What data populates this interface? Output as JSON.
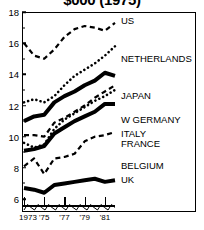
{
  "chart": {
    "title": "$000 (1975)",
    "type": "line",
    "xlabel": "",
    "ylabel": "",
    "legend_position": "inline-right"
  },
  "chart_data": {
    "type": "line",
    "title": "$000 (1975)",
    "xlabel": "",
    "ylabel": "",
    "xlim": [
      1973,
      1982
    ],
    "ylim": [
      5.2,
      18
    ],
    "grid": false,
    "legend_position": "inline-right",
    "x": [
      1973,
      1974,
      1975,
      1976,
      1977,
      1978,
      1979,
      1980,
      1981,
      1982
    ],
    "y_ticks": [
      6,
      8,
      10,
      12,
      14,
      16,
      18
    ],
    "x_tick_labels": [
      "1973",
      "'75",
      "'77",
      "'79",
      "'81"
    ],
    "x_tick_values": [
      1973,
      1975,
      1977,
      1979,
      1981
    ],
    "series": [
      {
        "name": "US",
        "style": "dashed",
        "width": 2.2,
        "label_y": 17.4,
        "values": [
          16.0,
          15.2,
          15.0,
          15.6,
          16.4,
          16.9,
          17.1,
          17.0,
          16.8,
          17.3
        ]
      },
      {
        "name": "NETHERLANDS",
        "style": "dotted",
        "width": 2.6,
        "label_y": 15.0,
        "values": [
          12.2,
          12.4,
          12.2,
          12.6,
          13.3,
          13.9,
          14.3,
          14.7,
          15.2,
          15.8
        ]
      },
      {
        "name": "JAPAN",
        "style": "dotted",
        "width": 2.6,
        "label_y": 12.6,
        "values": [
          9.6,
          9.3,
          9.5,
          10.5,
          11.1,
          11.5,
          11.9,
          12.3,
          12.6,
          13.0
        ]
      },
      {
        "name": "W GERMANY",
        "style": "solid-thick",
        "width": 4.0,
        "label_y": 11.1,
        "values": [
          11.0,
          11.3,
          11.4,
          12.2,
          12.6,
          12.9,
          13.3,
          13.6,
          14.1,
          13.9
        ]
      },
      {
        "name": "FRANCE",
        "style": "dashed",
        "width": 2.2,
        "label_y": 9.5,
        "values": [
          10.1,
          10.1,
          10.0,
          10.9,
          11.2,
          11.6,
          12.0,
          12.5,
          12.9,
          13.3
        ]
      },
      {
        "name": "BELGIUM",
        "style": "solid-thick",
        "width": 4.0,
        "label_y": 8.1,
        "values": [
          9.1,
          9.2,
          9.4,
          10.2,
          10.6,
          11.0,
          11.3,
          11.6,
          12.1,
          12.1
        ]
      },
      {
        "name": "ITALY",
        "style": "dashed",
        "width": 2.2,
        "label_y": 10.2,
        "values": [
          8.1,
          8.6,
          7.6,
          8.6,
          8.7,
          8.9,
          9.7,
          10.0,
          10.1,
          10.3
        ]
      },
      {
        "name": "UK",
        "style": "solid-thick",
        "width": 4.0,
        "label_y": 7.2,
        "values": [
          6.7,
          6.6,
          6.4,
          6.9,
          7.0,
          7.1,
          7.2,
          7.3,
          7.1,
          7.2
        ]
      }
    ],
    "annotation": {
      "name": "baseline-zigzag",
      "description": "sawtooth trace along bottom axis"
    }
  }
}
